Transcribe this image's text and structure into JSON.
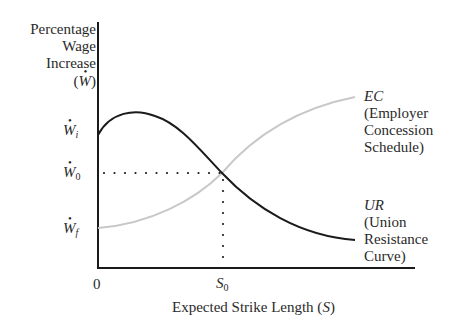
{
  "y_axis": {
    "title_lines": [
      "Percentage",
      "Wage",
      "Increase"
    ],
    "symbol": "W",
    "symbol_wrap_open": "(",
    "symbol_wrap_close": ")"
  },
  "x_axis": {
    "label_prefix": "Expected Strike Length (",
    "label_symbol": "S",
    "label_suffix": ")",
    "origin": "0",
    "tick_symbol": "S",
    "tick_subscript": "0"
  },
  "y_ticks": [
    {
      "symbol": "W",
      "subscript": "i"
    },
    {
      "symbol": "W",
      "subscript": "0"
    },
    {
      "symbol": "W",
      "subscript": "f"
    }
  ],
  "curves": {
    "ec": {
      "abbr": "EC",
      "lines": [
        "(Employer",
        "Concession",
        "Schedule)"
      ],
      "color": "#c8c8c8"
    },
    "ur": {
      "abbr": "UR",
      "lines": [
        "(Union",
        "Resistance",
        "Curve)"
      ],
      "color": "#1a1a1a"
    }
  },
  "colors": {
    "axis": "#1a1a1a",
    "guide_dots": "#1a1a1a"
  }
}
